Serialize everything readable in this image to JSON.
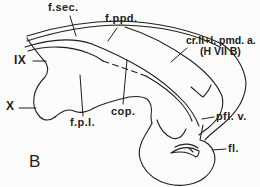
{
  "figure": {
    "panel_letter": "B",
    "labels": {
      "f_sec": "f.sec.",
      "f_ppd": "f.ppd.",
      "roman_ix": "IX",
      "roman_x": "X",
      "f_p_l": "f.p.l.",
      "cop": "cop.",
      "cr_pmd_line1": "cr.II+l. pmd. a.",
      "cr_pmd_line2": "(H VII B)",
      "pfl_v": "pfl. v.",
      "fl": "fl."
    },
    "colors": {
      "ink": "#1e1e1e",
      "background": "#fcfcfb"
    }
  }
}
